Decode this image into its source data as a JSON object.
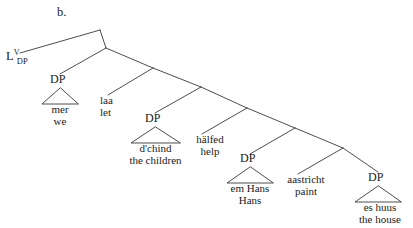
{
  "figure": {
    "example_label": "b.",
    "type": "syntax-tree",
    "language_note": "Swiss German cross-serial dependency tree"
  },
  "colors": {
    "line": "#3a3a3a",
    "text": "#1a1a1a",
    "background": "#ffffff"
  },
  "root": {
    "base": "L",
    "superscript": "V",
    "subscript": "DP"
  },
  "nodes": [
    {
      "label": "DP"
    },
    {
      "label": "DP"
    },
    {
      "label": "DP"
    },
    {
      "label": "DP"
    }
  ],
  "terminals": [
    {
      "source": "mer",
      "gloss": "we"
    },
    {
      "source": "laa",
      "gloss": "let"
    },
    {
      "source": "d'chind",
      "gloss": "the children"
    },
    {
      "source": "hälfed",
      "gloss": "help"
    },
    {
      "source": "em Hans",
      "gloss": "Hans"
    },
    {
      "source": "aastricht",
      "gloss": "paint"
    },
    {
      "source": "es huus",
      "gloss": "the house"
    }
  ],
  "geometry": {
    "width": 413,
    "height": 228,
    "branch_points": [
      {
        "x": 100,
        "y": 30
      },
      {
        "x": 106,
        "y": 48
      },
      {
        "x": 153,
        "y": 68
      },
      {
        "x": 201,
        "y": 87
      },
      {
        "x": 247,
        "y": 108
      },
      {
        "x": 295,
        "y": 128
      }
    ]
  }
}
